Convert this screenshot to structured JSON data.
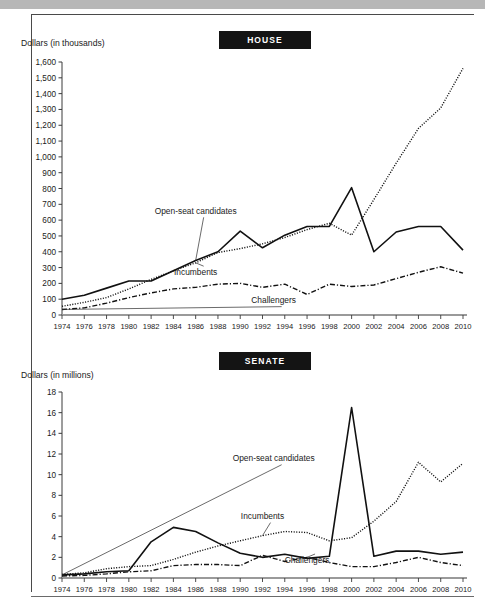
{
  "figure": {
    "background_color": "#ffffff",
    "topbar_color": "#b7b7b7",
    "frame_color": "#4a4a4a",
    "badge_bg": "#141414",
    "badge_fg": "#ffffff"
  },
  "chart_data": [
    {
      "type": "line",
      "title": "HOUSE",
      "xlabel": "",
      "ylabel": "Dollars (in thousands)",
      "ylim": [
        0,
        1600
      ],
      "ytick_step": 100,
      "yticks": [
        "0",
        "100",
        "200",
        "300",
        "400",
        "500",
        "600",
        "700",
        "800",
        "900",
        "1,000",
        "1,100",
        "1,200",
        "1,300",
        "1,400",
        "1,500",
        "1,600"
      ],
      "grid": false,
      "legend_position": "inline-annotations",
      "categories": [
        "1974",
        "1976",
        "1978",
        "1980",
        "1982",
        "1984",
        "1986",
        "1988",
        "1990",
        "1992",
        "1994",
        "1996",
        "1998",
        "2000",
        "2002",
        "2004",
        "2006",
        "2008",
        "2010"
      ],
      "series": [
        {
          "name": "Open-seat candidates",
          "style": "solid",
          "values": [
            100,
            125,
            170,
            215,
            215,
            280,
            345,
            400,
            530,
            425,
            505,
            560,
            560,
            805,
            400,
            525,
            560,
            560,
            410
          ],
          "label_x": 1986,
          "label_y": 640
        },
        {
          "name": "Incumbents",
          "style": "dotted",
          "values": [
            55,
            80,
            110,
            165,
            225,
            280,
            330,
            395,
            420,
            450,
            490,
            540,
            580,
            505,
            730,
            960,
            1180,
            1310,
            1560
          ],
          "label_x": 1986,
          "label_y": 255
        },
        {
          "name": "Challengers",
          "style": "dashdot",
          "values": [
            35,
            45,
            75,
            110,
            140,
            165,
            175,
            195,
            200,
            175,
            195,
            130,
            195,
            180,
            190,
            230,
            270,
            305,
            265
          ],
          "label_x": 1993,
          "label_y": 75
        }
      ]
    },
    {
      "type": "line",
      "title": "SENATE",
      "xlabel": "",
      "ylabel": "Dollars (in millions)",
      "ylim": [
        0,
        18
      ],
      "ytick_step": 2,
      "yticks": [
        "0",
        "2",
        "4",
        "6",
        "8",
        "10",
        "12",
        "14",
        "16",
        "18"
      ],
      "grid": false,
      "legend_position": "inline-annotations",
      "categories": [
        "1974",
        "1976",
        "1978",
        "1980",
        "1982",
        "1984",
        "1986",
        "1988",
        "1990",
        "1992",
        "1994",
        "1996",
        "1998",
        "2000",
        "2002",
        "2004",
        "2006",
        "2008",
        "2010"
      ],
      "series": [
        {
          "name": "Open-seat candidates",
          "style": "solid",
          "values": [
            0.3,
            0.4,
            0.6,
            0.7,
            3.5,
            4.9,
            4.5,
            3.4,
            2.4,
            2.0,
            2.3,
            1.9,
            2.1,
            16.5,
            2.1,
            2.6,
            2.6,
            2.3,
            2.5
          ],
          "label_x": 1997,
          "label_y": 11.3
        },
        {
          "name": "Incumbents",
          "style": "dotted",
          "values": [
            0.35,
            0.5,
            0.9,
            1.1,
            1.2,
            1.8,
            2.5,
            3.1,
            3.6,
            4.1,
            4.5,
            4.4,
            3.6,
            3.9,
            5.5,
            7.4,
            11.2,
            9.3,
            11.1
          ],
          "label_x": 1992,
          "label_y": 5.7
        },
        {
          "name": "Challengers",
          "style": "dashdot",
          "values": [
            0.2,
            0.25,
            0.4,
            0.6,
            0.7,
            1.2,
            1.3,
            1.3,
            1.2,
            2.2,
            1.6,
            2.0,
            1.5,
            1.1,
            1.1,
            1.5,
            2.0,
            1.5,
            1.2
          ],
          "label_x": 1996,
          "label_y": 1.5
        }
      ]
    }
  ]
}
